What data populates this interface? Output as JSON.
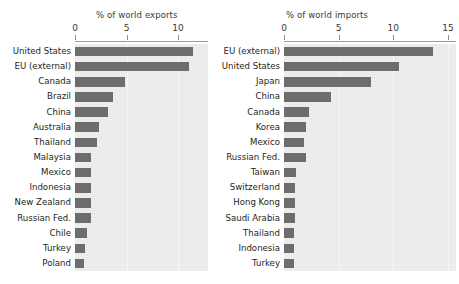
{
  "figure": {
    "background_color": "#ffffff",
    "plot_background_color": "#ececeb",
    "bar_color": "#6d6d6d",
    "axis_color": "#9a9a9a"
  },
  "chart_data": [
    {
      "type": "bar",
      "orientation": "horizontal",
      "title": "% of world exports",
      "xlabel": "% of world exports",
      "ylabel": "",
      "xlim": [
        0,
        12.5
      ],
      "xticks": [
        0,
        5,
        10
      ],
      "xtick_labels": [
        "0",
        "5",
        "10"
      ],
      "grid": true,
      "legend": "none",
      "categories": [
        "United States",
        "EU (external)",
        "Canada",
        "Brazil",
        "China",
        "Australia",
        "Thailand",
        "Malaysia",
        "Mexico",
        "Indonesia",
        "New Zealand",
        "Russian Fed.",
        "Chile",
        "Turkey",
        "Poland"
      ],
      "values": [
        11.5,
        11.1,
        4.9,
        3.7,
        3.2,
        2.3,
        2.1,
        1.6,
        1.6,
        1.6,
        1.6,
        1.6,
        1.2,
        1.0,
        0.9
      ]
    },
    {
      "type": "bar",
      "orientation": "horizontal",
      "title": "% of world imports",
      "xlabel": "% of world imports",
      "ylabel": "",
      "xlim": [
        0,
        15.8
      ],
      "xticks": [
        0,
        5,
        10,
        15
      ],
      "xtick_labels": [
        "0",
        "5",
        "10",
        "15"
      ],
      "grid": true,
      "legend": "none",
      "categories": [
        "EU (external)",
        "United States",
        "Japan",
        "China",
        "Canada",
        "Korea",
        "Mexico",
        "Russian Fed.",
        "Taiwan",
        "Switzerland",
        "Hong Kong",
        "Saudi Arabia",
        "Thailand",
        "Indonesia",
        "Turkey"
      ],
      "values": [
        13.6,
        10.5,
        8.0,
        4.3,
        2.3,
        2.0,
        1.85,
        2.0,
        1.1,
        1.0,
        1.0,
        1.0,
        0.95,
        0.95,
        0.95
      ]
    }
  ]
}
